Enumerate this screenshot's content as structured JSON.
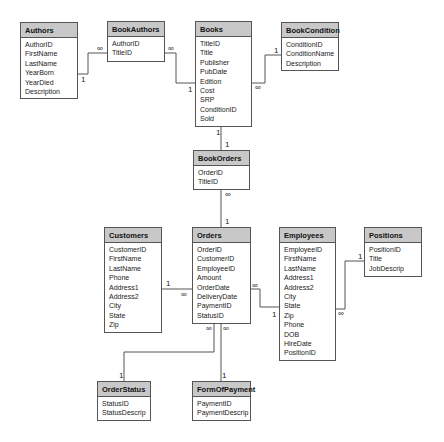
{
  "tables": [
    {
      "name": "Authors",
      "fields": [
        "AuthorID",
        "FirstName",
        "LastName",
        "YearBorn",
        "YearDied",
        "Description"
      ],
      "pos": [
        20,
        22,
        58,
        77
      ]
    },
    {
      "name": "BookAuthors",
      "fields": [
        "AuthorID",
        "TitleID"
      ],
      "pos": [
        107,
        21,
        58,
        41
      ]
    },
    {
      "name": "Books",
      "fields": [
        "TitleID",
        "Title",
        "Publisher",
        "PubDate",
        "Edition",
        "Cost",
        "SRP",
        "ConditionID",
        "Sold"
      ],
      "pos": [
        195,
        21,
        57,
        106
      ]
    },
    {
      "name": "BookCondition",
      "fields": [
        "ConditionID",
        "ConditionName",
        "Description"
      ],
      "pos": [
        281,
        22,
        58,
        49
      ]
    },
    {
      "name": "BookOrders",
      "fields": [
        "OrderID",
        "TitleID"
      ],
      "pos": [
        193,
        150,
        57,
        40
      ]
    },
    {
      "name": "Customers",
      "fields": [
        "CustomerID",
        "FirstName",
        "LastName",
        "Phone",
        "Address1",
        "Address2",
        "City",
        "State",
        "Zip"
      ],
      "pos": [
        104,
        227,
        58,
        106
      ]
    },
    {
      "name": "Orders",
      "fields": [
        "OrderID",
        "CustomerID",
        "EmployeeID",
        "Amount",
        "OrderDate",
        "DeliveryDate",
        "PaymentID",
        "StatusID"
      ],
      "pos": [
        192,
        227,
        59,
        97
      ]
    },
    {
      "name": "Employees",
      "fields": [
        "EmployeeID",
        "FirstName",
        "LastName",
        "Address1",
        "Address2",
        "City",
        "State",
        "Zip",
        "Phone",
        "DOB",
        "HireDate",
        "PositionID"
      ],
      "pos": [
        279,
        227,
        57,
        134
      ]
    },
    {
      "name": "Positions",
      "fields": [
        "PositionID",
        "Title",
        "JobDescrip"
      ],
      "pos": [
        364,
        227,
        58,
        50
      ]
    },
    {
      "name": "OrderStatus",
      "fields": [
        "StatusID",
        "StatusDescrip"
      ],
      "pos": [
        97,
        381,
        54,
        40
      ]
    },
    {
      "name": "FormOfPayment",
      "fields": [
        "PaymentID",
        "PaymentDescrip"
      ],
      "pos": [
        192,
        381,
        59,
        40
      ]
    }
  ],
  "relationships": [
    {
      "from": "Authors",
      "to": "BookAuthors",
      "from_card": "1",
      "to_card": "∞"
    },
    {
      "from": "BookAuthors",
      "to": "Books",
      "from_card": "∞",
      "to_card": "1"
    },
    {
      "from": "Books",
      "to": "BookCondition",
      "from_card": "∞",
      "to_card": "1"
    },
    {
      "from": "Books",
      "to": "BookOrders",
      "from_card": "1",
      "to_card": "1"
    },
    {
      "from": "BookOrders",
      "to": "Orders",
      "from_card": "∞",
      "to_card": "1"
    },
    {
      "from": "Customers",
      "to": "Orders",
      "from_card": "1",
      "to_card": "∞"
    },
    {
      "from": "Orders",
      "to": "Employees",
      "from_card": "∞",
      "to_card": "1"
    },
    {
      "from": "Employees",
      "to": "Positions",
      "from_card": "∞",
      "to_card": "1"
    },
    {
      "from": "Orders",
      "to": "OrderStatus",
      "from_card": "∞",
      "to_card": "1"
    },
    {
      "from": "Orders",
      "to": "FormOfPayment",
      "from_card": "∞",
      "to_card": "1"
    }
  ],
  "labels": {
    "one": "1",
    "many": "∞"
  }
}
